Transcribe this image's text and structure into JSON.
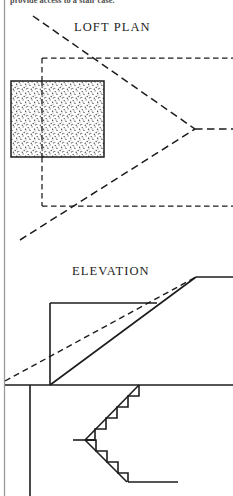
{
  "sheet": {
    "width": 233,
    "height": 496,
    "background_color": "#ffffff",
    "ink_color": "#1c1c1c",
    "margin_rule_color": "#9a9a9a"
  },
  "cropped_body_text": {
    "text": "provide access to a stair case.",
    "note": "partially cropped line of body text at top edge"
  },
  "titles": {
    "loft_plan": "LOFT PLAN",
    "elevation": "ELEVATION"
  },
  "loft_plan": {
    "label": "LOFT PLAN",
    "stipple_block": {
      "name": "loft-floor-area",
      "x": 11,
      "y": 81,
      "width": 93,
      "height": 76,
      "border": "solid",
      "fill": "stipple"
    },
    "dashed_opening": {
      "name": "loft-opening-outline",
      "corner_x": 42,
      "corner_y": 58,
      "bottom_y": 206
    },
    "hip_apex": {
      "x": 195,
      "y": 129
    },
    "ridge_end_x": 233,
    "upper_eave_y": 58,
    "lower_eave_y": 206,
    "hip_start_upper": {
      "x": 33,
      "y": 18
    },
    "hip_start_lower": {
      "x": 20,
      "y": 240
    }
  },
  "elevation": {
    "label": "ELEVATION",
    "wall_line_x": 50,
    "ceiling_y": 303,
    "ceiling_right_x": 157,
    "ridge_y": 277,
    "ridge_right_x": 233,
    "roof_peak_x": 196,
    "floor_y": 385,
    "floor_right_x": 233,
    "post_line": {
      "x": 30,
      "y_top": 385,
      "y_bottom": 496
    },
    "dashed_sight_line": {
      "x1": 5,
      "y1": 378,
      "x2": 196,
      "y2": 277
    }
  },
  "staircase": {
    "name": "stair-section",
    "upper_flight": {
      "step_count": 5,
      "top_x": 138,
      "top_y": 385,
      "landing_x": 85,
      "landing_y": 440
    },
    "landing": {
      "x": 73,
      "y": 440,
      "width": 14
    },
    "lower_flight": {
      "step_count": 4,
      "landing_x": 85,
      "landing_y": 440,
      "bottom_x": 127,
      "bottom_y": 482
    },
    "lower_floor_y": 482,
    "lower_floor_right_x": 178
  }
}
